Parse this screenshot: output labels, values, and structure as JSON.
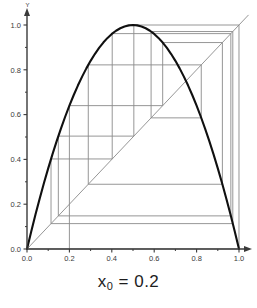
{
  "caption": {
    "var": "x",
    "sub": "0",
    "eq": " = 0.2"
  },
  "axes": {
    "y_axis_label": "Y",
    "x_ticks": [
      "0.0",
      "0.2",
      "0.4",
      "0.6",
      "0.8",
      "1.0"
    ],
    "y_ticks": [
      "0.0",
      "0.2",
      "0.4",
      "0.6",
      "0.8",
      "1.0"
    ],
    "x_tick_values": [
      0.0,
      0.2,
      0.4,
      0.6,
      0.8,
      1.0
    ],
    "y_tick_values": [
      0.0,
      0.2,
      0.4,
      0.6,
      0.8,
      1.0
    ],
    "minor_tick_values": [
      0.1,
      0.3,
      0.5,
      0.7,
      0.9
    ],
    "xlim": [
      0.0,
      1.0
    ],
    "ylim": [
      0.0,
      1.0
    ]
  },
  "colors": {
    "curve": "#101010",
    "diagonal": "#8a8a8a",
    "cobweb": "#8a8a8a",
    "axis": "#3a3a3a",
    "background": "#ffffff",
    "text": "#1d1d1d"
  },
  "chart_data": {
    "type": "line",
    "title": "",
    "subtitle": "",
    "xlabel": "",
    "ylabel": "Y",
    "xlim": [
      0.0,
      1.0
    ],
    "ylim": [
      0.0,
      1.0
    ],
    "grid": false,
    "legend": "none",
    "annotations": [
      "x_0 = 0.2"
    ],
    "series": [
      {
        "name": "f(x) = 4x(1-x)",
        "kind": "curve",
        "style": "thick-black",
        "x": [
          0.0,
          0.02,
          0.04,
          0.06,
          0.08,
          0.1,
          0.12,
          0.14,
          0.16,
          0.18,
          0.2,
          0.22,
          0.24,
          0.26,
          0.28,
          0.3,
          0.32,
          0.34,
          0.36,
          0.38,
          0.4,
          0.42,
          0.44,
          0.46,
          0.48,
          0.5,
          0.52,
          0.54,
          0.56,
          0.58,
          0.6,
          0.62,
          0.64,
          0.66,
          0.68,
          0.7,
          0.72,
          0.74,
          0.76,
          0.78,
          0.8,
          0.82,
          0.84,
          0.86,
          0.88,
          0.9,
          0.92,
          0.94,
          0.96,
          0.98,
          1.0
        ],
        "y": [
          0.0,
          0.0784,
          0.1536,
          0.2256,
          0.2944,
          0.36,
          0.4224,
          0.4816,
          0.5376,
          0.5904,
          0.64,
          0.6864,
          0.7296,
          0.7696,
          0.8064,
          0.84,
          0.8704,
          0.8976,
          0.9216,
          0.9424,
          0.96,
          0.9744,
          0.9856,
          0.9936,
          0.9984,
          1.0,
          0.9984,
          0.9936,
          0.9856,
          0.9744,
          0.96,
          0.9424,
          0.9216,
          0.8976,
          0.8704,
          0.84,
          0.8064,
          0.7696,
          0.7296,
          0.6864,
          0.64,
          0.5904,
          0.5376,
          0.4816,
          0.4224,
          0.36,
          0.2944,
          0.2256,
          0.1536,
          0.0784,
          0.0
        ]
      },
      {
        "name": "y = x",
        "kind": "diagonal",
        "style": "thin-grey",
        "x": [
          0.0,
          1.0
        ],
        "y": [
          0.0,
          1.0
        ]
      }
    ],
    "orbit": {
      "map": "f(x) = 4x(1-x)",
      "r": 4,
      "x0": 0.2,
      "iterates": [
        0.2,
        0.64,
        0.9216,
        0.289014,
        0.821939,
        0.585421,
        0.970813,
        0.113339,
        0.401974,
        0.961563,
        0.147837,
        0.503926,
        0.999938,
        0.000246,
        0.000984
      ]
    }
  }
}
